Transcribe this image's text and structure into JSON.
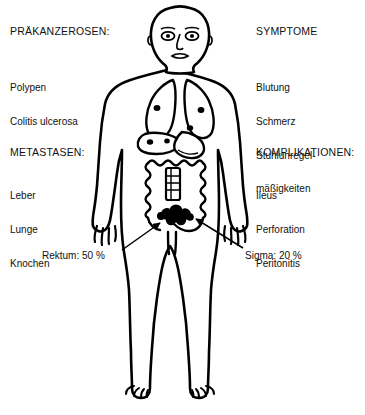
{
  "figure": {
    "title_alt": "Kolorektales Karzinom Schema",
    "line_color": "#000000",
    "fill_color": "#ffffff",
    "lesion_color": "#000000"
  },
  "blocks": [
    {
      "id": "prakanzerosen",
      "heading": "PRÄKANZEROSEN:",
      "items": [
        "Polypen",
        "Colitis ulcerosa"
      ]
    },
    {
      "id": "symptome",
      "heading": "SYMPTOME",
      "items": [
        "Blutung",
        "Schmerz",
        "Stuhlunregel-",
        "mäßigkeiten"
      ]
    },
    {
      "id": "metastasen",
      "heading": "METASTASEN:",
      "items": [
        "Leber",
        "Lunge",
        "Knochen"
      ]
    },
    {
      "id": "komplikationen",
      "heading": "KOMPLIKATIONEN:",
      "items": [
        "Ileus",
        "Perforation",
        "Peritonitis"
      ]
    }
  ],
  "callouts": [
    {
      "id": "rektum",
      "label": "Rektum: 50 %",
      "site": "Rektum",
      "percent": "50 %"
    },
    {
      "id": "sigma",
      "label": "Sigma: 20 %",
      "site": "Sigma",
      "percent": "20 %"
    }
  ],
  "anatomy_markers": {
    "lung_metastases_count": 2,
    "liver_metastases_count": 2,
    "tumor_mass_label": "rektosigmoidaler Tumor"
  }
}
